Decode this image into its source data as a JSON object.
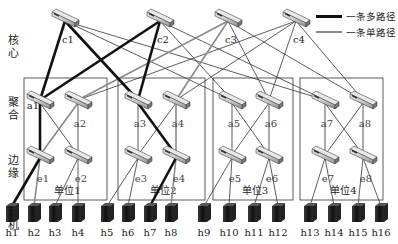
{
  "diagram": {
    "type": "fat-tree network topology",
    "layers": [
      {
        "id": "core",
        "label": "核心"
      },
      {
        "id": "aggregation",
        "label": "聚合"
      },
      {
        "id": "edge",
        "label": "边缘"
      },
      {
        "id": "host",
        "label": "主机"
      }
    ],
    "legend": {
      "multi_path_label": "一条多路径",
      "single_path_label": "一条单路径",
      "multi_path_color": "#111111",
      "single_path_color": "#8a8a8a",
      "normal_link_color": "#333333"
    },
    "core_switches": [
      {
        "id": "c1",
        "label": "c1",
        "x": 65,
        "y": 18
      },
      {
        "id": "c2",
        "label": "c2",
        "x": 160,
        "y": 18
      },
      {
        "id": "c3",
        "label": "c3",
        "x": 228,
        "y": 18
      },
      {
        "id": "c4",
        "label": "c4",
        "x": 296,
        "y": 18
      }
    ],
    "pods": [
      {
        "id": "pod1",
        "label": "单位1",
        "x": 24,
        "w": 83,
        "agg": [
          {
            "id": "a1",
            "label": "a1",
            "x": 40
          },
          {
            "id": "a2",
            "label": "a2",
            "x": 78
          }
        ],
        "edge": [
          {
            "id": "e1",
            "label": "e1",
            "x": 40
          },
          {
            "id": "e2",
            "label": "e2",
            "x": 78
          }
        ],
        "hosts": [
          {
            "label": "h1",
            "x": 12
          },
          {
            "label": "h2",
            "x": 34
          },
          {
            "label": "h3",
            "x": 55
          },
          {
            "label": "h4",
            "x": 78
          }
        ]
      },
      {
        "id": "pod2",
        "label": "单位2",
        "x": 118,
        "w": 87,
        "agg": [
          {
            "id": "a3",
            "label": "a3",
            "x": 138
          },
          {
            "id": "a4",
            "label": "a4",
            "x": 176
          }
        ],
        "edge": [
          {
            "id": "e3",
            "label": "e3",
            "x": 138
          },
          {
            "id": "e4",
            "label": "e4",
            "x": 176
          }
        ],
        "hosts": [
          {
            "label": "h5",
            "x": 107
          },
          {
            "label": "h6",
            "x": 128
          },
          {
            "label": "h7",
            "x": 150
          },
          {
            "label": "h8",
            "x": 171
          }
        ]
      },
      {
        "id": "pod3",
        "label": "单位3",
        "x": 213,
        "w": 80,
        "agg": [
          {
            "id": "a5",
            "label": "a5",
            "x": 232
          },
          {
            "id": "a6",
            "label": "a6",
            "x": 269
          }
        ],
        "edge": [
          {
            "id": "e5",
            "label": "e5",
            "x": 232
          },
          {
            "id": "e6",
            "label": "e6",
            "x": 269
          }
        ],
        "hosts": [
          {
            "label": "h9",
            "x": 204
          },
          {
            "label": "h10",
            "x": 229
          },
          {
            "label": "h11",
            "x": 254
          },
          {
            "label": "h12",
            "x": 278
          }
        ]
      },
      {
        "id": "pod4",
        "label": "单位4",
        "x": 300,
        "w": 83,
        "agg": [
          {
            "id": "a7",
            "label": "a7",
            "x": 325
          },
          {
            "id": "a8",
            "label": "a8",
            "x": 363
          }
        ],
        "edge": [
          {
            "id": "e7",
            "label": "e7",
            "x": 325
          },
          {
            "id": "e8",
            "label": "e8",
            "x": 363
          }
        ],
        "hosts": [
          {
            "label": "h13",
            "x": 310
          },
          {
            "label": "h14",
            "x": 334
          },
          {
            "label": "h15",
            "x": 358
          },
          {
            "label": "h16",
            "x": 381
          }
        ]
      }
    ],
    "links": [
      {
        "from": "c1",
        "to": "a1",
        "type": "multi"
      },
      {
        "from": "c1",
        "to": "a3",
        "type": "multi"
      },
      {
        "from": "c1",
        "to": "a5",
        "type": "normal"
      },
      {
        "from": "c1",
        "to": "a7",
        "type": "normal"
      },
      {
        "from": "c2",
        "to": "a1",
        "type": "multi"
      },
      {
        "from": "c2",
        "to": "a3",
        "type": "multi"
      },
      {
        "from": "c2",
        "to": "a5",
        "type": "normal"
      },
      {
        "from": "c2",
        "to": "a7",
        "type": "normal"
      },
      {
        "from": "c3",
        "to": "a2",
        "type": "single"
      },
      {
        "from": "c3",
        "to": "a4",
        "type": "single"
      },
      {
        "from": "c3",
        "to": "a6",
        "type": "normal"
      },
      {
        "from": "c3",
        "to": "a8",
        "type": "normal"
      },
      {
        "from": "c4",
        "to": "a2",
        "type": "normal"
      },
      {
        "from": "c4",
        "to": "a4",
        "type": "normal"
      },
      {
        "from": "c4",
        "to": "a6",
        "type": "normal"
      },
      {
        "from": "c4",
        "to": "a8",
        "type": "normal"
      },
      {
        "from": "a1",
        "to": "e1",
        "type": "multi"
      },
      {
        "from": "a1",
        "to": "e2",
        "type": "normal"
      },
      {
        "from": "a2",
        "to": "e1",
        "type": "single"
      },
      {
        "from": "a2",
        "to": "e2",
        "type": "normal"
      },
      {
        "from": "a3",
        "to": "e3",
        "type": "normal"
      },
      {
        "from": "a3",
        "to": "e4",
        "type": "multi"
      },
      {
        "from": "a4",
        "to": "e3",
        "type": "normal"
      },
      {
        "from": "a4",
        "to": "e4",
        "type": "single"
      },
      {
        "from": "a5",
        "to": "e5",
        "type": "normal"
      },
      {
        "from": "a5",
        "to": "e6",
        "type": "normal"
      },
      {
        "from": "a6",
        "to": "e5",
        "type": "normal"
      },
      {
        "from": "a6",
        "to": "e6",
        "type": "normal"
      },
      {
        "from": "a7",
        "to": "e7",
        "type": "normal"
      },
      {
        "from": "a7",
        "to": "e8",
        "type": "normal"
      },
      {
        "from": "a8",
        "to": "e7",
        "type": "normal"
      },
      {
        "from": "a8",
        "to": "e8",
        "type": "normal"
      },
      {
        "from": "e1",
        "to": "h1",
        "type": "multi"
      },
      {
        "from": "e1",
        "to": "h2",
        "type": "single"
      },
      {
        "from": "e2",
        "to": "h3",
        "type": "normal"
      },
      {
        "from": "e2",
        "to": "h4",
        "type": "normal"
      },
      {
        "from": "e3",
        "to": "h5",
        "type": "normal"
      },
      {
        "from": "e3",
        "to": "h6",
        "type": "normal"
      },
      {
        "from": "e4",
        "to": "h7",
        "type": "multi"
      },
      {
        "from": "e4",
        "to": "h8",
        "type": "single"
      },
      {
        "from": "e5",
        "to": "h9",
        "type": "normal"
      },
      {
        "from": "e5",
        "to": "h10",
        "type": "normal"
      },
      {
        "from": "e6",
        "to": "h11",
        "type": "normal"
      },
      {
        "from": "e6",
        "to": "h12",
        "type": "normal"
      },
      {
        "from": "e7",
        "to": "h13",
        "type": "normal"
      },
      {
        "from": "e7",
        "to": "h14",
        "type": "normal"
      },
      {
        "from": "e8",
        "to": "h15",
        "type": "normal"
      },
      {
        "from": "e8",
        "to": "h16",
        "type": "normal"
      }
    ]
  }
}
